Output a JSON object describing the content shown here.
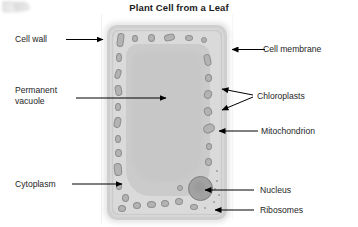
{
  "title": "Plant Cell from a Leaf",
  "diagram": {
    "labels_left": [
      {
        "id": "cell-wall",
        "text": "Cell wall"
      },
      {
        "id": "permanent-vacuole",
        "text": "Permanent\nvacuole"
      },
      {
        "id": "cytoplasm",
        "text": "Cytoplasm"
      }
    ],
    "labels_right": [
      {
        "id": "cell-membrane",
        "text": "Cell membrane"
      },
      {
        "id": "chloroplasts",
        "text": "Chloroplasts"
      },
      {
        "id": "mitochondrion",
        "text": "Mitochondrion"
      },
      {
        "id": "nucleus",
        "text": "Nucleus"
      },
      {
        "id": "ribosomes",
        "text": "Ribosomes"
      }
    ],
    "colors": {
      "background": "#ffffff",
      "text": "#1e1e1e",
      "cell_wall": "#cfcfcf",
      "cytoplasm": "#d7d7d7",
      "vacuole": "#cbcbcb",
      "organelle_fill": "#b3b3b3",
      "organelle_stroke": "#8e8e8e",
      "nucleus": "#a2a2a2",
      "leader_line": "#000000"
    },
    "organelles": {
      "chloroplast_count": 28,
      "nucleus_count": 1,
      "ribosome_count": 9
    }
  }
}
